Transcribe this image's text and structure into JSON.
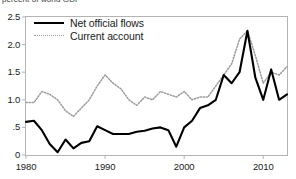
{
  "figure": {
    "supra_label": "percent of world GDP"
  },
  "legend": {
    "position": "top-left-inside",
    "entries": [
      {
        "label": "Net official flows",
        "style": "solid",
        "color": "#000000"
      },
      {
        "label": "Current account",
        "style": "dotted",
        "color": "#9a9a9a"
      }
    ]
  },
  "axes": {
    "y_ticks": [
      "0",
      ".5",
      "1.0",
      "1.5",
      "2.0",
      "2.5"
    ],
    "x_ticks": [
      "1980",
      "1990",
      "2000",
      "2010"
    ],
    "ylim": [
      0,
      2.5
    ],
    "xlim": [
      1980,
      2013
    ],
    "grid": false
  },
  "chart_data": {
    "type": "line",
    "title": "",
    "subtitle": "",
    "xlabel": "",
    "ylabel": "percent of world GDP",
    "ylim": [
      0,
      2.5
    ],
    "xlim": [
      1980,
      2013
    ],
    "grid": false,
    "legend_position": "top-left-inside",
    "x": [
      1980,
      1981,
      1982,
      1983,
      1984,
      1985,
      1986,
      1987,
      1988,
      1989,
      1990,
      1991,
      1992,
      1993,
      1994,
      1995,
      1996,
      1997,
      1998,
      1999,
      2000,
      2001,
      2002,
      2003,
      2004,
      2005,
      2006,
      2007,
      2008,
      2009,
      2010,
      2011,
      2012,
      2013
    ],
    "series": [
      {
        "name": "Net official flows",
        "style": "solid",
        "color": "#000000",
        "values": [
          0.6,
          0.62,
          0.45,
          0.2,
          0.05,
          0.28,
          0.12,
          0.22,
          0.25,
          0.52,
          0.45,
          0.38,
          0.38,
          0.38,
          0.42,
          0.44,
          0.48,
          0.5,
          0.45,
          0.15,
          0.5,
          0.62,
          0.85,
          0.9,
          1.0,
          1.45,
          1.3,
          1.5,
          2.25,
          1.4,
          1.0,
          1.55,
          1.0,
          1.1
        ]
      },
      {
        "name": "Current account",
        "style": "dotted",
        "color": "#9a9a9a",
        "values": [
          0.95,
          0.95,
          1.15,
          1.1,
          1.0,
          0.8,
          0.7,
          0.85,
          1.0,
          1.25,
          1.45,
          1.3,
          1.2,
          1.0,
          0.9,
          1.05,
          1.0,
          1.15,
          1.1,
          1.05,
          1.15,
          1.0,
          1.05,
          1.05,
          1.25,
          1.45,
          1.65,
          2.1,
          2.25,
          1.8,
          1.3,
          1.5,
          1.45,
          1.6
        ]
      }
    ]
  }
}
